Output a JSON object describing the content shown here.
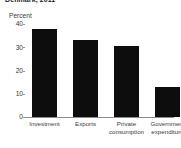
{
  "chart_data": {
    "type": "bar",
    "title": "Denmark, 2011",
    "subtitle": "",
    "ylabel": "Percent",
    "xlabel": "",
    "categories": [
      "Investment",
      "Private\nconsumption",
      "Exports",
      "Government\nexpenditure"
    ],
    "category_lines": [
      [
        "Investment"
      ],
      [
        "Exports"
      ],
      [
        "Private",
        "consumption"
      ],
      [
        "Government",
        "expenditure"
      ]
    ],
    "categories_display": [
      "Investment",
      "Exports",
      "Private consumption",
      "Government expenditure"
    ],
    "values": [
      38,
      33,
      30.5,
      13
    ],
    "ylim": [
      0,
      40
    ],
    "yticks": [
      0,
      10,
      20,
      30,
      40
    ],
    "ytick_labels": [
      "0",
      "10",
      "20",
      "30",
      "40"
    ],
    "grid": false,
    "legend": null,
    "bar_color": "#0d0d0d",
    "axis_color": "#8d8d8d",
    "text_color": "#3a3a3a"
  }
}
